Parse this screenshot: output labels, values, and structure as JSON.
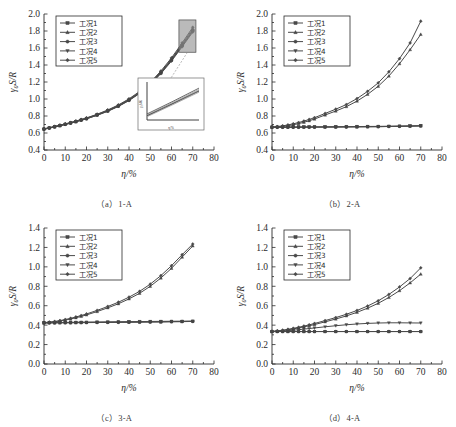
{
  "figure": {
    "name": "four-panel-curve-figure",
    "panels": [
      "a",
      "b",
      "c",
      "d"
    ]
  },
  "legend": {
    "entries": [
      {
        "label": "工况1",
        "marker": "square"
      },
      {
        "label": "工况2",
        "marker": "triangle-up"
      },
      {
        "label": "工况3",
        "marker": "circle"
      },
      {
        "label": "工况4",
        "marker": "triangle-down"
      },
      {
        "label": "工况5",
        "marker": "diamond"
      }
    ]
  },
  "captions": {
    "a": "（a）1-A",
    "b": "（b）2-A",
    "c": "（c）3-A",
    "d": "（d）4-A"
  },
  "colors": {
    "curve": "#4a4a4a",
    "axis": "#2b2b2b",
    "zoom_highlight": "#8f8f8f",
    "background": "#ffffff"
  },
  "chart_data": [
    {
      "panel": "a",
      "type": "line",
      "title": "（a）1-A",
      "xlabel": "η/%",
      "ylabel": "γ₀S/R",
      "xlim": [
        0,
        80
      ],
      "ylim": [
        0.4,
        2.0
      ],
      "xticks": [
        0,
        10,
        20,
        30,
        40,
        50,
        60,
        70,
        80
      ],
      "yticks": [
        "0.4",
        "0.6",
        "0.8",
        "1.0",
        "1.2",
        "1.4",
        "1.6",
        "1.8",
        "2.0"
      ],
      "grid": false,
      "legend_position": "top-left",
      "annotation": "magnified inset of 60–70% region",
      "x": [
        0,
        2.5,
        5,
        7.5,
        10,
        12.5,
        15,
        17.5,
        20,
        25,
        30,
        35,
        40,
        45,
        50,
        55,
        60,
        65,
        70
      ],
      "series": [
        {
          "name": "工况1",
          "marker": "square",
          "values": [
            0.645,
            0.658,
            0.672,
            0.686,
            0.701,
            0.716,
            0.733,
            0.75,
            0.768,
            0.81,
            0.858,
            0.915,
            0.985,
            1.07,
            1.175,
            1.305,
            1.455,
            1.625,
            1.8
          ]
        },
        {
          "name": "工况2",
          "marker": "triangle-up",
          "values": [
            0.648,
            0.661,
            0.675,
            0.69,
            0.705,
            0.721,
            0.738,
            0.756,
            0.774,
            0.817,
            0.866,
            0.924,
            0.995,
            1.081,
            1.187,
            1.318,
            1.47,
            1.645,
            1.825
          ]
        },
        {
          "name": "工况3",
          "marker": "circle",
          "values": [
            0.646,
            0.659,
            0.673,
            0.688,
            0.703,
            0.718,
            0.735,
            0.753,
            0.771,
            0.813,
            0.861,
            0.918,
            0.989,
            1.074,
            1.179,
            1.309,
            1.46,
            1.632,
            1.808
          ]
        },
        {
          "name": "工况4",
          "marker": "triangle-down",
          "values": [
            0.644,
            0.657,
            0.671,
            0.685,
            0.7,
            0.715,
            0.732,
            0.749,
            0.766,
            0.808,
            0.855,
            0.912,
            0.981,
            1.065,
            1.169,
            1.298,
            1.446,
            1.614,
            1.787
          ]
        },
        {
          "name": "工况5",
          "marker": "diamond",
          "values": [
            0.65,
            0.663,
            0.678,
            0.692,
            0.708,
            0.724,
            0.741,
            0.759,
            0.778,
            0.821,
            0.871,
            0.93,
            1.002,
            1.089,
            1.196,
            1.329,
            1.484,
            1.66,
            1.843
          ]
        }
      ],
      "inset": {
        "xlim": [
          60,
          70
        ],
        "ylim": [
          1.4,
          1.9
        ],
        "xlabel": "η/%",
        "ylabel": "γ₀S/R"
      }
    },
    {
      "panel": "b",
      "type": "line",
      "title": "（b）2-A",
      "xlabel": "η/%",
      "ylabel": "γ₀S/R",
      "xlim": [
        0,
        80
      ],
      "ylim": [
        0.4,
        2.0
      ],
      "xticks": [
        0,
        10,
        20,
        30,
        40,
        50,
        60,
        70,
        80
      ],
      "yticks": [
        "0.4",
        "0.6",
        "0.8",
        "1.0",
        "1.2",
        "1.4",
        "1.6",
        "1.8",
        "2.0"
      ],
      "grid": false,
      "legend_position": "top-left",
      "x": [
        0,
        2.5,
        5,
        7.5,
        10,
        12.5,
        15,
        17.5,
        20,
        25,
        30,
        35,
        40,
        45,
        50,
        55,
        60,
        65,
        70
      ],
      "series": [
        {
          "name": "工况1",
          "marker": "square",
          "values": [
            0.668,
            0.668,
            0.668,
            0.668,
            0.668,
            0.669,
            0.669,
            0.669,
            0.67,
            0.67,
            0.671,
            0.672,
            0.673,
            0.674,
            0.675,
            0.677,
            0.679,
            0.681,
            0.684
          ]
        },
        {
          "name": "工况2",
          "marker": "triangle-up",
          "values": [
            0.668,
            0.672,
            0.678,
            0.686,
            0.697,
            0.71,
            0.726,
            0.744,
            0.764,
            0.812,
            0.858,
            0.91,
            0.975,
            1.055,
            1.15,
            1.27,
            1.415,
            1.58,
            1.76
          ]
        },
        {
          "name": "工况3",
          "marker": "circle",
          "values": [
            0.668,
            0.668,
            0.668,
            0.668,
            0.668,
            0.668,
            0.669,
            0.669,
            0.669,
            0.67,
            0.67,
            0.671,
            0.672,
            0.673,
            0.674,
            0.676,
            0.678,
            0.68,
            0.683
          ]
        },
        {
          "name": "工况4",
          "marker": "triangle-down",
          "values": [
            0.668,
            0.669,
            0.669,
            0.67,
            0.67,
            0.671,
            0.671,
            0.672,
            0.672,
            0.673,
            0.674,
            0.675,
            0.676,
            0.677,
            0.678,
            0.68,
            0.682,
            0.684,
            0.686
          ]
        },
        {
          "name": "工况5",
          "marker": "diamond",
          "values": [
            0.67,
            0.676,
            0.684,
            0.695,
            0.708,
            0.723,
            0.74,
            0.759,
            0.78,
            0.83,
            0.88,
            0.935,
            1.005,
            1.09,
            1.19,
            1.32,
            1.475,
            1.66,
            1.915
          ]
        }
      ]
    },
    {
      "panel": "c",
      "type": "line",
      "title": "（c）3-A",
      "xlabel": "η/%",
      "ylabel": "γ₀S/R",
      "xlim": [
        0,
        80
      ],
      "ylim": [
        0.0,
        1.4
      ],
      "xticks": [
        0,
        10,
        20,
        30,
        40,
        50,
        60,
        70,
        80
      ],
      "yticks": [
        "0.0",
        "0.2",
        "0.4",
        "0.6",
        "0.8",
        "1.0",
        "1.2",
        "1.4"
      ],
      "grid": false,
      "legend_position": "top-left",
      "x": [
        0,
        2.5,
        5,
        7.5,
        10,
        12.5,
        15,
        17.5,
        20,
        25,
        30,
        35,
        40,
        45,
        50,
        55,
        60,
        65,
        70
      ],
      "series": [
        {
          "name": "工况1",
          "marker": "square",
          "values": [
            0.424,
            0.424,
            0.424,
            0.425,
            0.425,
            0.425,
            0.426,
            0.426,
            0.427,
            0.428,
            0.429,
            0.43,
            0.431,
            0.432,
            0.433,
            0.434,
            0.436,
            0.437,
            0.439
          ]
        },
        {
          "name": "工况2",
          "marker": "triangle-up",
          "values": [
            0.424,
            0.428,
            0.434,
            0.442,
            0.452,
            0.463,
            0.476,
            0.49,
            0.505,
            0.54,
            0.578,
            0.62,
            0.67,
            0.728,
            0.8,
            0.885,
            0.985,
            1.1,
            1.215
          ]
        },
        {
          "name": "工况3",
          "marker": "circle",
          "values": [
            0.424,
            0.424,
            0.424,
            0.425,
            0.425,
            0.425,
            0.426,
            0.426,
            0.426,
            0.427,
            0.428,
            0.429,
            0.43,
            0.431,
            0.432,
            0.433,
            0.435,
            0.436,
            0.438
          ]
        },
        {
          "name": "工况4",
          "marker": "triangle-down",
          "values": [
            0.424,
            0.425,
            0.426,
            0.427,
            0.428,
            0.429,
            0.43,
            0.431,
            0.432,
            0.433,
            0.434,
            0.435,
            0.436,
            0.437,
            0.438,
            0.439,
            0.44,
            0.441,
            0.442
          ]
        },
        {
          "name": "工况5",
          "marker": "diamond",
          "values": [
            0.426,
            0.431,
            0.438,
            0.447,
            0.458,
            0.47,
            0.484,
            0.499,
            0.515,
            0.552,
            0.592,
            0.636,
            0.688,
            0.748,
            0.822,
            0.91,
            1.012,
            1.125,
            1.235
          ]
        }
      ]
    },
    {
      "panel": "d",
      "type": "line",
      "title": "（d）4-A",
      "xlabel": "η/%",
      "ylabel": "γ₀S/R",
      "xlim": [
        0,
        80
      ],
      "ylim": [
        0.0,
        1.4
      ],
      "xticks": [
        0,
        10,
        20,
        30,
        40,
        50,
        60,
        70,
        80
      ],
      "yticks": [
        "0.0",
        "0.2",
        "0.4",
        "0.6",
        "0.8",
        "1.0",
        "1.2",
        "1.4"
      ],
      "grid": false,
      "legend_position": "top-left",
      "x": [
        0,
        2.5,
        5,
        7.5,
        10,
        12.5,
        15,
        17.5,
        20,
        25,
        30,
        35,
        40,
        45,
        50,
        55,
        60,
        65,
        70
      ],
      "series": [
        {
          "name": "工况1",
          "marker": "square",
          "values": [
            0.334,
            0.334,
            0.334,
            0.334,
            0.334,
            0.334,
            0.334,
            0.334,
            0.334,
            0.334,
            0.334,
            0.334,
            0.334,
            0.334,
            0.334,
            0.334,
            0.334,
            0.334,
            0.334
          ]
        },
        {
          "name": "工况2",
          "marker": "triangle-up",
          "values": [
            0.334,
            0.338,
            0.344,
            0.352,
            0.361,
            0.371,
            0.382,
            0.394,
            0.406,
            0.434,
            0.463,
            0.495,
            0.532,
            0.575,
            0.625,
            0.685,
            0.755,
            0.835,
            0.925
          ]
        },
        {
          "name": "工况3",
          "marker": "circle",
          "values": [
            0.334,
            0.334,
            0.334,
            0.334,
            0.334,
            0.334,
            0.334,
            0.334,
            0.334,
            0.334,
            0.334,
            0.334,
            0.334,
            0.334,
            0.334,
            0.334,
            0.334,
            0.334,
            0.334
          ]
        },
        {
          "name": "工况4",
          "marker": "triangle-down",
          "values": [
            0.334,
            0.336,
            0.339,
            0.343,
            0.348,
            0.353,
            0.359,
            0.365,
            0.371,
            0.383,
            0.394,
            0.404,
            0.412,
            0.418,
            0.422,
            0.424,
            0.424,
            0.423,
            0.422
          ]
        },
        {
          "name": "工况5",
          "marker": "diamond",
          "values": [
            0.336,
            0.341,
            0.348,
            0.357,
            0.367,
            0.378,
            0.39,
            0.403,
            0.417,
            0.447,
            0.478,
            0.512,
            0.551,
            0.597,
            0.651,
            0.716,
            0.793,
            0.88,
            0.99
          ]
        }
      ]
    }
  ]
}
